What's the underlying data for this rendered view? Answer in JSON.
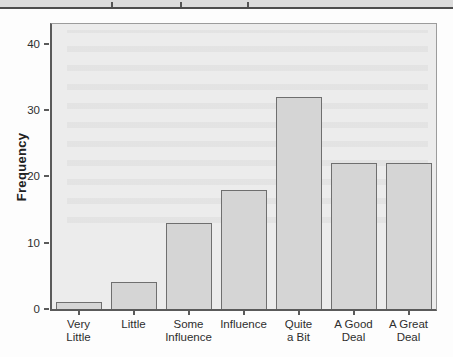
{
  "chart_data": {
    "type": "bar",
    "title": "",
    "xlabel": "",
    "ylabel": "Frequency",
    "categories": [
      "Very Little",
      "Little",
      "Some Influence",
      "Influence",
      "Quite a Bit",
      "A Good Deal",
      "A Great Deal"
    ],
    "category_label_lines": [
      [
        "Very",
        "Little"
      ],
      [
        "Little"
      ],
      [
        "Some",
        "Influence"
      ],
      [
        "Influence"
      ],
      [
        "Quite",
        "a Bit"
      ],
      [
        "A Good",
        "Deal"
      ],
      [
        "A Great",
        "Deal"
      ]
    ],
    "values": [
      1,
      4,
      13,
      18,
      32,
      22,
      22
    ],
    "ylim": [
      0,
      43
    ],
    "yticks": [
      0,
      10,
      20,
      30,
      40
    ],
    "grid": false,
    "legend": "none",
    "colors": {
      "bar_fill": "#d5d5d5",
      "bar_border": "#6f6f6f",
      "plot_background": "#ececec",
      "axis_color": "#5a5a5a",
      "text_color": "#2e2e2e",
      "cropped_edge_band": "#dcdcdc",
      "cropped_edge_line": "#4d4d4d"
    }
  }
}
